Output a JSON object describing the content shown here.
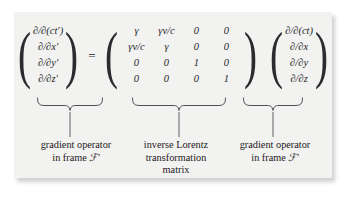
{
  "figure": {
    "equation": {
      "left_vector": {
        "name": "gradient-operator-primed",
        "entries": [
          "∂/∂(ct′)",
          "∂/∂x′",
          "∂/∂y′",
          "∂/∂z′"
        ]
      },
      "equals": "=",
      "matrix": {
        "name": "inverse-lorentz-matrix",
        "rows": [
          [
            "γ",
            "γv/c",
            "0",
            "0"
          ],
          [
            "γv/c",
            "γ",
            "0",
            "0"
          ],
          [
            "0",
            "0",
            "1",
            "0"
          ],
          [
            "0",
            "0",
            "0",
            "1"
          ]
        ]
      },
      "right_vector": {
        "name": "gradient-operator-unprimed",
        "entries": [
          "∂/∂(ct)",
          "∂/∂x",
          "∂/∂y",
          "∂/∂z"
        ]
      }
    },
    "captions": {
      "left": {
        "line1": "gradient operator",
        "line2_prefix": "in frame ",
        "line2_symbol": "ℱ′"
      },
      "center": {
        "line1": "inverse Lorentz",
        "line2": "transformation",
        "line3": "matrix"
      },
      "right": {
        "line1": "gradient operator",
        "line2_prefix": "in frame ",
        "line2_symbol": "ℱ′"
      }
    },
    "colors": {
      "card_background": "#f2f2f0",
      "page_background": "#ffffff",
      "text": "#25262a",
      "brace_stroke": "#3a3b3f"
    }
  }
}
